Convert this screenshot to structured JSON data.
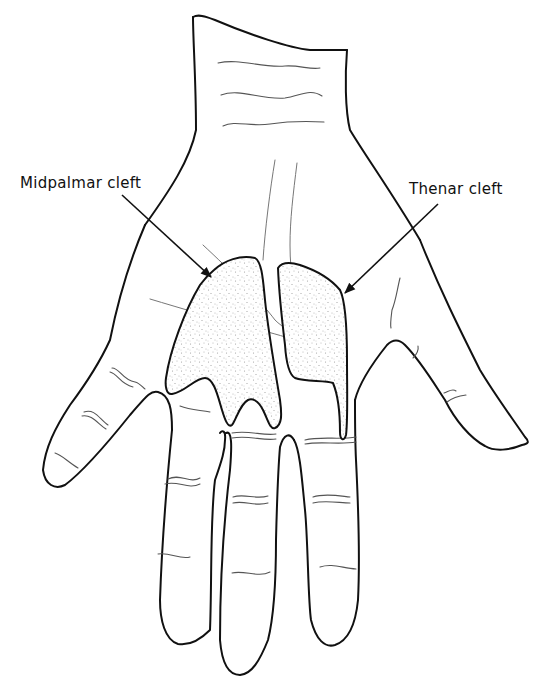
{
  "figure": {
    "labels": [
      {
        "id": "midpalmar",
        "text": "Midpalmar cleft"
      },
      {
        "id": "thenar",
        "text": "Thenar cleft"
      }
    ]
  },
  "colors": {
    "line": "#111111",
    "crease": "#555555",
    "stipple": "#9a9a9a",
    "background": "#ffffff"
  }
}
